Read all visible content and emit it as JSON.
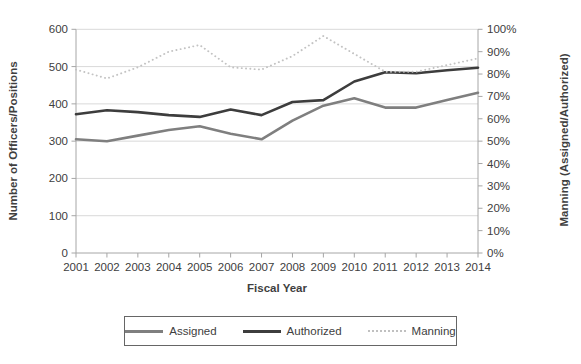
{
  "figure": {
    "x_axis_title": "Fiscal Year",
    "left_axis_title": "Number of Officers/Positions",
    "right_axis_title": "Manning (Assigned/Authorized)"
  },
  "legend": {
    "items": [
      {
        "label": "Assigned",
        "swatch": "solid-gray"
      },
      {
        "label": "Authorized",
        "swatch": "solid-black"
      },
      {
        "label": "Manning",
        "swatch": "dotted-light-gray"
      }
    ]
  },
  "colors": {
    "assigned": "#7f7f7f",
    "authorized": "#3d3d3d",
    "manning": "#c3c3c3",
    "gridline": "#d9d9d9",
    "axis": "#a6a6a6",
    "text": "#404040",
    "legend_border": "#666666"
  },
  "chart_data": {
    "type": "line",
    "title": "",
    "x_label": "Fiscal Year",
    "categories": [
      "2001",
      "2002",
      "2003",
      "2004",
      "2005",
      "2006",
      "2007",
      "2008",
      "2009",
      "2010",
      "2011",
      "2012",
      "2013",
      "2014"
    ],
    "series": [
      {
        "name": "Assigned",
        "axis": "left",
        "style": "solid",
        "color_key": "assigned",
        "values": [
          305,
          300,
          315,
          330,
          340,
          320,
          305,
          355,
          395,
          415,
          390,
          390,
          410,
          430
        ]
      },
      {
        "name": "Authorized",
        "axis": "left",
        "style": "solid",
        "color_key": "authorized",
        "values": [
          372,
          383,
          378,
          370,
          365,
          385,
          370,
          405,
          410,
          460,
          485,
          482,
          490,
          497
        ]
      },
      {
        "name": "Manning",
        "axis": "right",
        "style": "dotted",
        "color_key": "manning",
        "values": [
          82,
          78,
          83,
          90,
          93,
          83,
          82,
          88,
          97,
          89,
          81,
          81,
          84,
          87
        ]
      }
    ],
    "left_axis": {
      "title": "Number of Officers/Positions",
      "min": 0,
      "max": 600,
      "tick_step": 100,
      "tick_labels": [
        "0",
        "100",
        "200",
        "300",
        "400",
        "500",
        "600"
      ]
    },
    "right_axis": {
      "title": "Manning (Assigned/Authorized)",
      "min": 0,
      "max": 100,
      "tick_step": 10,
      "tick_labels": [
        "0%",
        "10%",
        "20%",
        "30%",
        "40%",
        "50%",
        "60%",
        "70%",
        "80%",
        "90%",
        "100%"
      ]
    },
    "grid": "horizontal",
    "legend_position": "bottom"
  }
}
